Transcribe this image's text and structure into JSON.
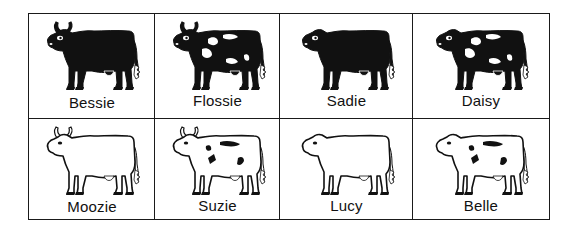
{
  "figure": {
    "rows": 2,
    "columns": 4,
    "cows": [
      {
        "name": "Bessie",
        "color": "black",
        "spotted": false,
        "horns": true
      },
      {
        "name": "Flossie",
        "color": "black",
        "spotted": true,
        "horns": true
      },
      {
        "name": "Sadie",
        "color": "black",
        "spotted": false,
        "horns": false
      },
      {
        "name": "Daisy",
        "color": "black",
        "spotted": true,
        "horns": false
      },
      {
        "name": "Moozie",
        "color": "white",
        "spotted": false,
        "horns": true
      },
      {
        "name": "Suzie",
        "color": "white",
        "spotted": true,
        "horns": true
      },
      {
        "name": "Lucy",
        "color": "white",
        "spotted": false,
        "horns": false
      },
      {
        "name": "Belle",
        "color": "white",
        "spotted": true,
        "horns": false
      }
    ]
  },
  "colors": {
    "ink": "#111111",
    "paper": "#ffffff",
    "border": "#1a1a1a"
  }
}
